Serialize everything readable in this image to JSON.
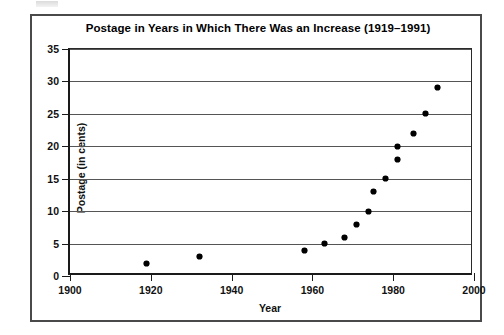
{
  "artifact": {
    "name": "scan-artifact-mark"
  },
  "chart_data": {
    "type": "scatter",
    "title": "Postage in Years in Which There Was an Increase (1919–1991)",
    "xlabel": "Year",
    "ylabel": "Postage (in cents)",
    "xlim": [
      1900,
      2000
    ],
    "ylim": [
      0,
      35
    ],
    "xticks": [
      1900,
      1920,
      1940,
      1960,
      1980,
      2000
    ],
    "xtick_labels": [
      "1900",
      "1920",
      "1940",
      "1960",
      "1980",
      "2000"
    ],
    "yticks": [
      0,
      5,
      10,
      15,
      20,
      25,
      30,
      35
    ],
    "ytick_labels": [
      "0",
      "5",
      "10",
      "15",
      "20",
      "25",
      "30",
      "35"
    ],
    "grid": "horizontal",
    "legend": "none",
    "marker": "filled-diamond",
    "marker_color": "#000000",
    "points": [
      {
        "x": 1919,
        "y": 2
      },
      {
        "x": 1932,
        "y": 3
      },
      {
        "x": 1958,
        "y": 4
      },
      {
        "x": 1963,
        "y": 5
      },
      {
        "x": 1968,
        "y": 6
      },
      {
        "x": 1971,
        "y": 8
      },
      {
        "x": 1974,
        "y": 10
      },
      {
        "x": 1975,
        "y": 13
      },
      {
        "x": 1978,
        "y": 15
      },
      {
        "x": 1981,
        "y": 18
      },
      {
        "x": 1981,
        "y": 20
      },
      {
        "x": 1985,
        "y": 22
      },
      {
        "x": 1988,
        "y": 25
      },
      {
        "x": 1991,
        "y": 29
      }
    ]
  }
}
